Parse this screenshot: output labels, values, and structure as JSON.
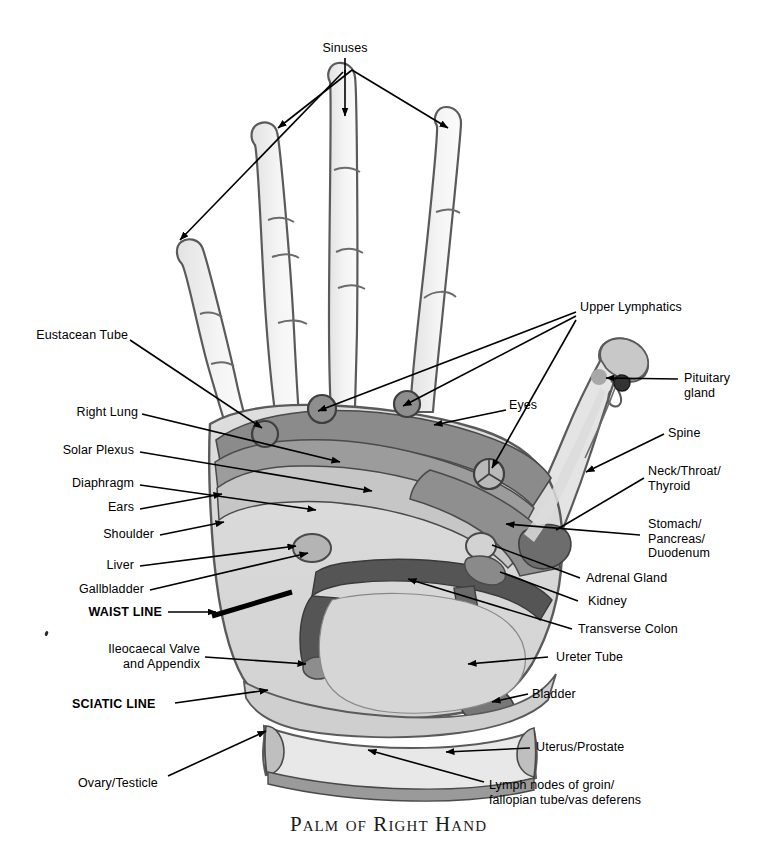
{
  "title": "Palm of Right Hand",
  "palette": {
    "ink": "#3f3f3f",
    "outline": "#555555",
    "skin_light": "#f2f2f2",
    "skin_finger": "#ececec",
    "zone_dark_band": "#8a8a8a",
    "zone_mid": "#9b9b9b",
    "zone_light": "#c9c9c9",
    "zone_pale": "#d8d8d8",
    "zone_very_dark": "#585858",
    "zone_highlight": "#efefef",
    "background": "#ffffff",
    "text": "#000000"
  },
  "labels": {
    "sinuses": "Sinuses",
    "upper_lymphatics": "Upper Lymphatics",
    "eustacean_tube": "Eustacean Tube",
    "right_lung": "Right Lung",
    "solar_plexus": "Solar Plexus",
    "diaphragm": "Diaphragm",
    "ears": "Ears",
    "shoulder": "Shoulder",
    "liver": "Liver",
    "gallbladder": "Gallbladder",
    "waist_line": "WAIST LINE",
    "ileocaecal_valve": "Ileocaecal Valve\nand Appendix",
    "sciatic_line": "SCIATIC LINE",
    "ovary_testicle": "Ovary/Testicle",
    "eyes": "Eyes",
    "pituitary_gland": "Pituitary\ngland",
    "spine": "Spine",
    "neck_throat_thyroid": "Neck/Throat/\nThyroid",
    "stomach_pancreas_duodenum": "Stomach/\nPancreas/\nDuodenum",
    "adrenal_gland": "Adrenal Gland",
    "kidney": "Kidney",
    "transverse_colon": "Transverse Colon",
    "ureter_tube": "Ureter Tube",
    "bladder": "Bladder",
    "uterus_prostate": "Uterus/Prostate",
    "lymph_nodes": "Lymph nodes of groin/\nfallopian tube/vas deferens"
  }
}
